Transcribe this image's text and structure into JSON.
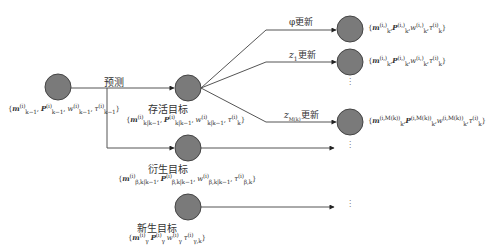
{
  "diagram": {
    "type": "tree-flow",
    "colors": {
      "node_fill": "#7a7a7a",
      "node_stroke": "#444444",
      "edge": "#555555"
    },
    "nodes": {
      "prior": {
        "label": "",
        "params": "{m_{k-1}^{(i)}, P_{k-1}^{(i)}, w_{k-1}^{(i)}, τ_{k-1}^{(i)}}"
      },
      "survival": {
        "label": "存活目标",
        "params": "{m_{k|k-1}^{(i)}, P_{k|k-1}^{(i)}, w_{k|k-1}^{(i)}, τ_k^{(i)}}"
      },
      "spawn": {
        "label": "衍生目标",
        "params": "{m_{β,k|k-1}^{(i)}, P_{β,k|k-1}^{(i)}, w_{β,k|k-1}^{(i)}, τ_{β,k}^{(i)}}"
      },
      "birth": {
        "label": "新生目标",
        "params": "{m_γ^{(i)} P_γ^{(i)} w_γ^{(i)} τ_{γ,k}^{(i)}}"
      },
      "update_phi": {
        "params": "{m_k^{(i,)},P_k^{(i,)},w_k^{(i,)},τ_k^{(i)}}"
      },
      "update_z1": {
        "params": "{m_k^{(i,)},P_k^{(i,)},w_k^{(i,)},τ_k^{(i)}}"
      },
      "update_zm": {
        "params": "{m_k^{(i,M(k))},P_k^{(i,M(k))},w_k^{(i,M(k))},τ_k^{(i)}}"
      }
    },
    "edges": {
      "predict": "预测",
      "phi_update": "φ更新",
      "z1_update": "z₁更新",
      "zm_update": "z_{M(k)}更新"
    },
    "ellipsis": "⋮"
  },
  "text": {
    "predict_label": "预测",
    "survival_label": "存活目标",
    "spawn_label": "衍生目标",
    "birth_label": "新生目标",
    "phi_update": "φ更新",
    "z1_update_base": "z",
    "z1_update_sub": "1",
    "z1_update_tail": "更新",
    "zm_update_base": "z",
    "zm_update_sub": "M(k)",
    "zm_update_tail": "更新",
    "prior_params": "{m",
    "ellipsis": "⋮"
  }
}
